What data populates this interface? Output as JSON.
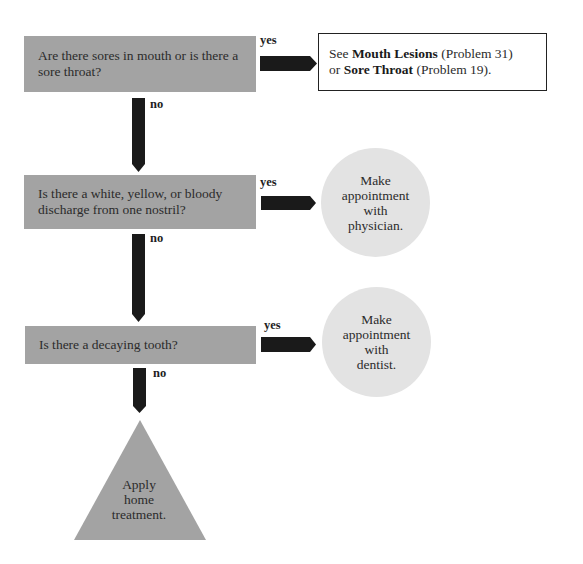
{
  "flowchart": {
    "questions": [
      {
        "text": "Are there sores in mouth or is there a sore throat?"
      },
      {
        "text": "Is there a white, yellow, or bloody discharge from one nostril?"
      },
      {
        "text": "Is there a decaying tooth?"
      }
    ],
    "branch_labels": {
      "yes": "yes",
      "no": "no"
    },
    "outcomes": {
      "referral": {
        "prefix": "See ",
        "ref1_title": "Mouth Lesions",
        "ref1_problem": " (Problem 31)",
        "joiner": "or ",
        "ref2_title": "Sore Throat",
        "ref2_problem": " (Problem 19)."
      },
      "physician": {
        "lines": [
          "Make",
          "appointment",
          "with",
          "physician."
        ]
      },
      "dentist": {
        "lines": [
          "Make",
          "appointment",
          "with",
          "dentist."
        ]
      },
      "home": {
        "lines": [
          "Apply",
          "home",
          "treatment."
        ]
      }
    },
    "colors": {
      "question_fill": "#a3a3a3",
      "circle_fill": "#e3e3e3",
      "arrow": "#1a1a1a",
      "triangle_fill": "#a3a3a3"
    }
  }
}
